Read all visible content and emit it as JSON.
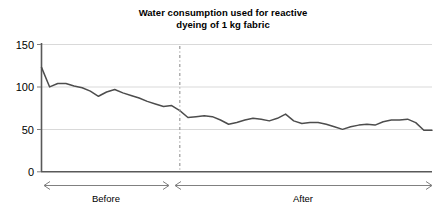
{
  "chart_data": {
    "type": "line",
    "title": "Water consumption used for reactive dyeing of 1 kg fabric",
    "title_line1": "Water consumption used for reactive",
    "title_line2": "dyeing of 1 kg fabric",
    "xlabel": "",
    "ylabel": "",
    "ylim": [
      0,
      150
    ],
    "yticks": [
      0,
      50,
      100,
      150
    ],
    "ytick_labels": [
      "0",
      "50",
      "100",
      "150"
    ],
    "grid": true,
    "legend": "none",
    "xaxis_ticks_visible": false,
    "series": [
      {
        "name": "Water consumption (litres per kg fabric)",
        "color": "#4d4d4d",
        "x": [
          0,
          1,
          2,
          3,
          4,
          5,
          6,
          7,
          8,
          9,
          10,
          11,
          12,
          13,
          14,
          15,
          16,
          17,
          18,
          19,
          20,
          21,
          22,
          23,
          24,
          25,
          26,
          27,
          28,
          29,
          30,
          31,
          32,
          33,
          34,
          35,
          36,
          37,
          38,
          39,
          40,
          41,
          42,
          43,
          44,
          45,
          46,
          47,
          48
        ],
        "values": [
          123,
          100,
          104,
          104,
          101,
          99,
          95,
          89,
          94,
          97,
          93,
          90,
          87,
          83,
          80,
          77,
          78,
          72,
          64,
          65,
          66,
          65,
          61,
          56,
          58,
          61,
          63,
          62,
          60,
          63,
          68,
          60,
          57,
          58,
          58,
          56,
          53,
          50,
          53,
          55,
          56,
          55,
          59,
          61,
          61,
          62,
          58,
          49,
          49
        ]
      }
    ],
    "divider": {
      "x_index": 17,
      "style": "dash-dot",
      "color": "#999999"
    },
    "regions": [
      {
        "label": "Before",
        "from_index": 0,
        "to_index": 17
      },
      {
        "label": "After",
        "from_index": 17,
        "to_index": 48
      }
    ]
  },
  "axis": {
    "y_label_150": "150",
    "y_label_100": "100",
    "y_label_50": "50",
    "y_label_0": "0"
  },
  "regions": {
    "before_label": "Before",
    "after_label": "After"
  },
  "colors": {
    "line": "#4d4d4d",
    "grid": "#d9d9d9",
    "axis": "#595959",
    "divider": "#999999",
    "arrow": "#808080",
    "text": "#000000",
    "background": "#ffffff"
  }
}
